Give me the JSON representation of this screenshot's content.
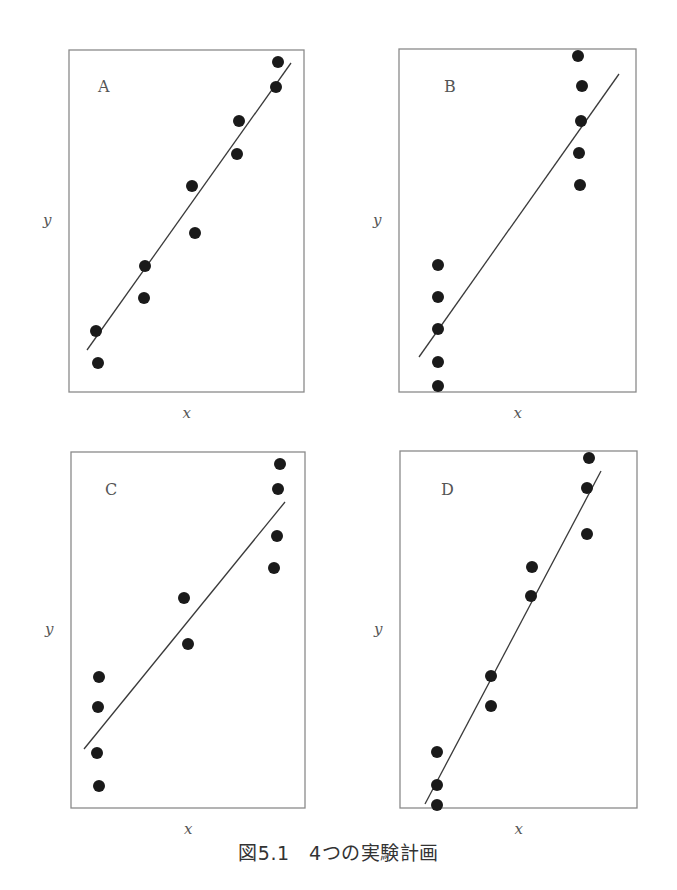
{
  "caption": "図5.1　4つの実験計画",
  "colors": {
    "frame": "#8a8a8a",
    "point": "#1a1a1a",
    "line": "#3a3a3a",
    "text": "#555555"
  },
  "chart_data": [
    {
      "type": "scatter",
      "title": "A",
      "xlabel": "x",
      "ylabel": "y",
      "grid": false,
      "frame": {
        "x0": 69,
        "y0": 50,
        "x1": 304,
        "y1": 392
      },
      "label_pos": [
        98,
        92
      ],
      "points": [
        [
          278,
          62
        ],
        [
          276,
          87
        ],
        [
          239,
          121
        ],
        [
          237,
          154
        ],
        [
          192,
          186
        ],
        [
          195,
          233
        ],
        [
          145,
          266
        ],
        [
          144,
          298
        ],
        [
          96,
          331
        ],
        [
          98,
          363
        ]
      ],
      "fit_line": [
        [
          87,
          350
        ],
        [
          291,
          63
        ]
      ]
    },
    {
      "type": "scatter",
      "title": "B",
      "xlabel": "x",
      "ylabel": "y",
      "grid": false,
      "frame": {
        "x0": 399,
        "y0": 49,
        "x1": 636,
        "y1": 392
      },
      "label_pos": [
        444,
        92
      ],
      "points": [
        [
          578,
          56
        ],
        [
          582,
          86
        ],
        [
          581,
          121
        ],
        [
          579,
          153
        ],
        [
          580,
          185
        ],
        [
          438,
          265
        ],
        [
          438,
          297
        ],
        [
          438,
          329
        ],
        [
          438,
          362
        ],
        [
          438,
          386
        ]
      ],
      "fit_line": [
        [
          419,
          357
        ],
        [
          619,
          74
        ]
      ]
    },
    {
      "type": "scatter",
      "title": "C",
      "xlabel": "x",
      "ylabel": "y",
      "grid": false,
      "frame": {
        "x0": 71,
        "y0": 452,
        "x1": 305,
        "y1": 808
      },
      "label_pos": [
        105,
        495
      ],
      "points": [
        [
          280,
          464
        ],
        [
          278,
          489
        ],
        [
          277,
          536
        ],
        [
          274,
          568
        ],
        [
          184,
          598
        ],
        [
          188,
          644
        ],
        [
          99,
          677
        ],
        [
          98,
          707
        ],
        [
          97,
          753
        ],
        [
          99,
          786
        ]
      ],
      "fit_line": [
        [
          84,
          749
        ],
        [
          285,
          502
        ]
      ]
    },
    {
      "type": "scatter",
      "title": "D",
      "xlabel": "x",
      "ylabel": "y",
      "grid": false,
      "frame": {
        "x0": 400,
        "y0": 451,
        "x1": 637,
        "y1": 808
      },
      "label_pos": [
        441,
        495
      ],
      "points": [
        [
          589,
          458
        ],
        [
          587,
          488
        ],
        [
          587,
          534
        ],
        [
          532,
          567
        ],
        [
          531,
          596
        ],
        [
          491,
          676
        ],
        [
          491,
          706
        ],
        [
          437,
          752
        ],
        [
          437,
          785
        ],
        [
          437,
          805
        ]
      ],
      "fit_line": [
        [
          425,
          804
        ],
        [
          601,
          471
        ]
      ]
    }
  ]
}
